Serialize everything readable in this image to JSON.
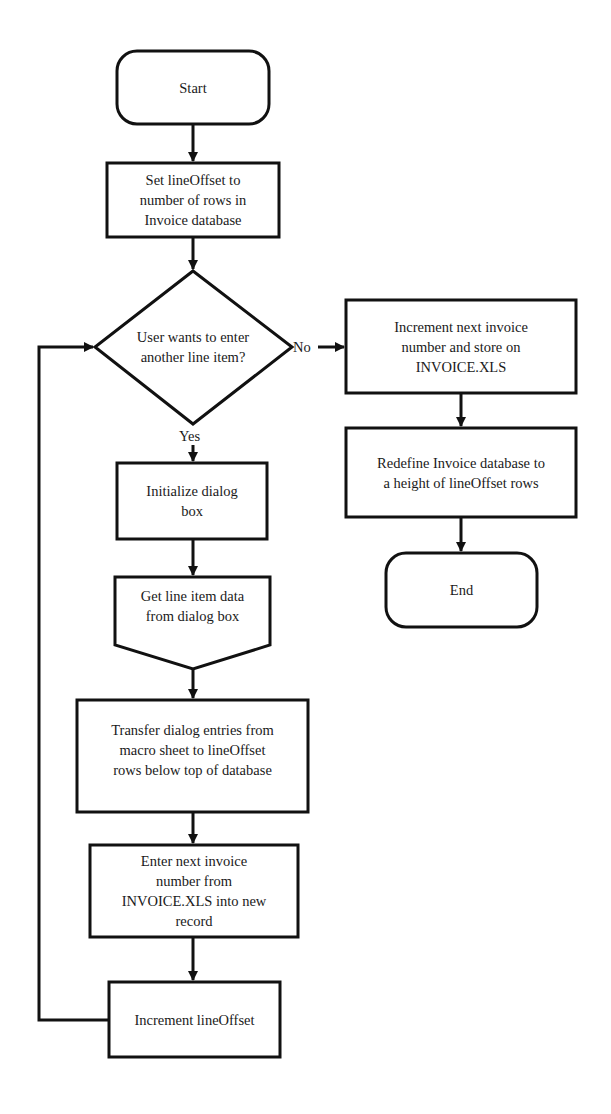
{
  "diagram": {
    "type": "flowchart",
    "colors": {
      "stroke": "#111111",
      "fill": "#ffffff",
      "text": "#1a1a1a"
    },
    "nodes": {
      "start": {
        "shape": "terminator",
        "label": "Start"
      },
      "set_offset": {
        "shape": "process",
        "label": "Set lineOffset to\nnumber of rows in\nInvoice database"
      },
      "decision": {
        "shape": "decision",
        "label": "User wants to enter\nanother line item?"
      },
      "init_dialog": {
        "shape": "process",
        "label": "Initialize dialog\nbox"
      },
      "get_data": {
        "shape": "offpage-connector",
        "label": "Get line item data\nfrom dialog box"
      },
      "transfer": {
        "shape": "process",
        "label": "Transfer dialog entries from\nmacro sheet to lineOffset\nrows below top of database"
      },
      "enter_number": {
        "shape": "process",
        "label": "Enter next invoice\nnumber from\nINVOICE.XLS into new\nrecord"
      },
      "increment_offset": {
        "shape": "process",
        "label": "Increment lineOffset"
      },
      "increment_invoice": {
        "shape": "process",
        "label": "Increment next invoice\nnumber and store on\nINVOICE.XLS"
      },
      "redefine": {
        "shape": "process",
        "label": "Redefine Invoice database to\na height of lineOffset rows"
      },
      "end": {
        "shape": "terminator",
        "label": "End"
      }
    },
    "edges": {
      "start_to_set": {
        "from": "start",
        "to": "set_offset",
        "label": ""
      },
      "set_to_decision": {
        "from": "set_offset",
        "to": "decision",
        "label": ""
      },
      "decision_yes": {
        "from": "decision",
        "to": "init_dialog",
        "label": "Yes"
      },
      "decision_no": {
        "from": "decision",
        "to": "increment_invoice",
        "label": "No"
      },
      "init_to_get": {
        "from": "init_dialog",
        "to": "get_data",
        "label": ""
      },
      "get_to_transfer": {
        "from": "get_data",
        "to": "transfer",
        "label": ""
      },
      "transfer_to_enter": {
        "from": "transfer",
        "to": "enter_number",
        "label": ""
      },
      "enter_to_increment": {
        "from": "enter_number",
        "to": "increment_offset",
        "label": ""
      },
      "loop_back": {
        "from": "increment_offset",
        "to": "decision",
        "label": ""
      },
      "incinv_to_redefine": {
        "from": "increment_invoice",
        "to": "redefine",
        "label": ""
      },
      "redefine_to_end": {
        "from": "redefine",
        "to": "end",
        "label": ""
      }
    }
  }
}
